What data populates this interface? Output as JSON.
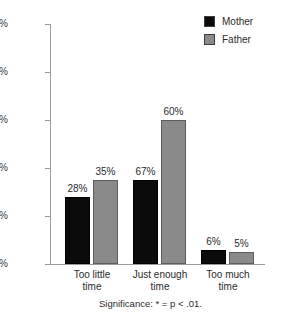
{
  "chart_data": {
    "type": "bar",
    "title": "",
    "subtitle": "",
    "xlabel": "",
    "ylabel": "",
    "ylim": [
      0,
      100
    ],
    "grid": false,
    "legend_position": "top-right",
    "categories": [
      "Too little time",
      "Just enough time",
      "Too much time"
    ],
    "category_lines": [
      [
        "Too little",
        "time"
      ],
      [
        "Just enough",
        "time"
      ],
      [
        "Too much",
        "time"
      ]
    ],
    "series": [
      {
        "name": "Mother",
        "color": "#0b0b0b",
        "values": [
          28,
          35,
          6
        ],
        "value_labels": [
          "28%",
          "67%",
          "6%"
        ]
      },
      {
        "name": "Father",
        "color": "#8a8a8a",
        "values": [
          35,
          60,
          5
        ],
        "value_labels": [
          "35%",
          "60%",
          "5%"
        ]
      }
    ],
    "series_values_by_category": [
      {
        "category": "Too little time",
        "Mother": 28,
        "Father": 35
      },
      {
        "category": "Just enough time",
        "Mother": 67,
        "Father": 60
      },
      {
        "category": "Too much time",
        "Mother": 6,
        "Father": 5
      }
    ],
    "ytick_values": [
      0,
      20,
      40,
      60,
      80,
      100
    ],
    "ytick_labels": [
      "0%",
      "20%",
      "40%",
      "60%",
      "80%",
      "100%"
    ],
    "annotations": [
      "Significance: * = p < .01."
    ]
  },
  "legend": {
    "items": [
      {
        "label": "Mother",
        "color": "#0b0b0b"
      },
      {
        "label": "Father",
        "color": "#8a8a8a"
      }
    ]
  },
  "yaxis": {
    "labels": [
      "100%",
      "80%",
      "60%",
      "40%",
      "20%",
      "0%"
    ]
  },
  "groups": [
    {
      "label_line1": "Too little",
      "label_line2": "time",
      "mother_value": "28%",
      "father_value": "35%"
    },
    {
      "label_line1": "Just enough",
      "label_line2": "time",
      "mother_value": "67%",
      "father_value": "60%"
    },
    {
      "label_line1": "Too much",
      "label_line2": "time",
      "mother_value": "6%",
      "father_value": "5%"
    }
  ],
  "footnote": {
    "text": "Significance: * = p < .01."
  }
}
